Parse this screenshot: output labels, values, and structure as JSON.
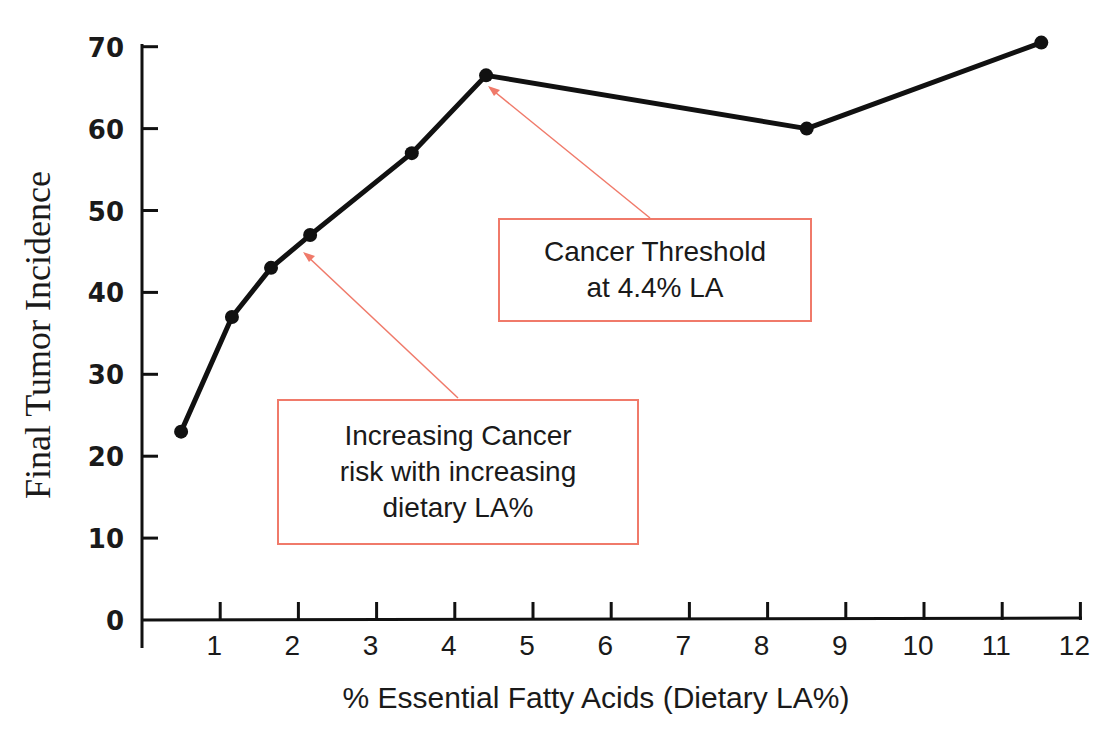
{
  "chart_data": {
    "type": "line",
    "title": "",
    "xlabel": "% Essential Fatty Acids (Dietary LA%)",
    "ylabel": "Final Tumor Incidence",
    "x_ticks": [
      "1",
      "2",
      "3",
      "4",
      "5",
      "6",
      "7",
      "8",
      "9",
      "10",
      "11",
      "12"
    ],
    "y_ticks": [
      "0",
      "10",
      "20",
      "30",
      "40",
      "50",
      "60",
      "70"
    ],
    "xlim": [
      0,
      12
    ],
    "ylim": [
      0,
      70
    ],
    "grid": false,
    "legend": null,
    "series": [
      {
        "name": "Final Tumor Incidence",
        "x": [
          0.5,
          1.15,
          1.65,
          2.15,
          3.45,
          4.4,
          8.5,
          11.5
        ],
        "y": [
          23,
          37,
          43,
          47,
          57,
          66.5,
          60,
          70.5
        ],
        "color": "#111111"
      }
    ],
    "annotations": [
      {
        "id": "threshold",
        "lines": [
          "Cancer Threshold",
          "at 4.4% LA"
        ],
        "points_to": {
          "x": 4.4,
          "y": 66.5
        },
        "border_color": "#f07a6a"
      },
      {
        "id": "increasing",
        "lines": [
          "Increasing Cancer",
          "risk with increasing",
          "dietary LA%"
        ],
        "points_to": {
          "x": 2.15,
          "y": 47
        },
        "border_color": "#f07a6a"
      }
    ]
  }
}
